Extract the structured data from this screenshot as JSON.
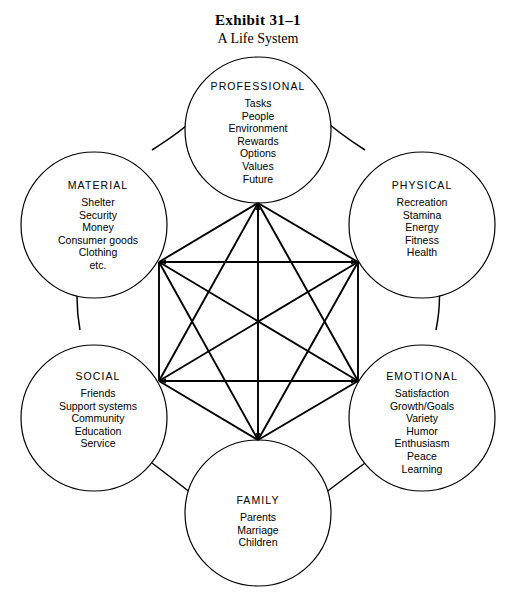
{
  "title": {
    "exhibit": "Exhibit 31–1",
    "subtitle": "A Life System"
  },
  "diagram": {
    "type": "hexagonal-network",
    "background_color": "#ffffff",
    "line_color": "#000000",
    "node_count": 6,
    "connection_pattern": "complete-graph-k6-star",
    "nodes": [
      {
        "id": "professional",
        "heading": "PROFESSIONAL",
        "items": [
          "Tasks",
          "People",
          "Environment",
          "Rewards",
          "Options",
          "Values",
          "Future"
        ]
      },
      {
        "id": "physical",
        "heading": "PHYSICAL",
        "items": [
          "Recreation",
          "Stamina",
          "Energy",
          "Fitness",
          "Health"
        ]
      },
      {
        "id": "emotional",
        "heading": "EMOTIONAL",
        "items": [
          "Satisfaction",
          "Growth/Goals",
          "Variety",
          "Humor",
          "Enthusiasm",
          "Peace",
          "Learning"
        ]
      },
      {
        "id": "family",
        "heading": "FAMILY",
        "items": [
          "Parents",
          "Marriage",
          "Children"
        ]
      },
      {
        "id": "social",
        "heading": "SOCIAL",
        "items": [
          "Friends",
          "Support systems",
          "Community",
          "Education",
          "Service"
        ]
      },
      {
        "id": "material",
        "heading": "MATERIAL",
        "items": [
          "Shelter",
          "Security",
          "Money",
          "Consumer goods",
          "Clothing",
          "etc."
        ]
      }
    ]
  }
}
